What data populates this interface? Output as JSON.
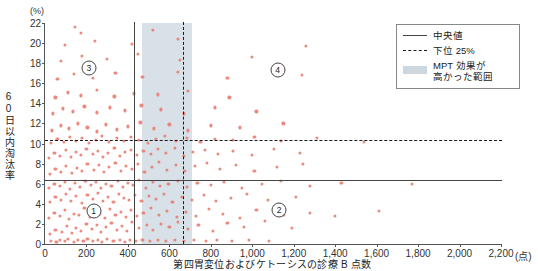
{
  "figure": {
    "title_clipped": "",
    "y_unit": "(%)",
    "x_unit": "(点)",
    "ylabel": "60日以内淘汰率",
    "xlabel": "第四胃変位およびケトーシスの診療 B 点数"
  },
  "legend": {
    "items": [
      {
        "key": "solid-line",
        "label": "中央値"
      },
      {
        "key": "dashed-line",
        "label": "下位 25%"
      },
      {
        "key": "shaded-band",
        "label": "MPT 効果が\n高かった範囲"
      },
      {
        "key": "shaded-band-line1",
        "label": "MPT 効果が"
      },
      {
        "key": "shaded-band-line2",
        "label": "高かった範囲"
      }
    ]
  },
  "regions": [
    {
      "id": "1",
      "label": "①",
      "text": "1",
      "x": 235,
      "y": 3.25
    },
    {
      "id": "2",
      "label": "②",
      "text": "2",
      "x": 1130,
      "y": 3.35
    },
    {
      "id": "3",
      "label": "③",
      "text": "3",
      "x": 212,
      "y": 17.5
    },
    {
      "id": "4",
      "label": "④",
      "text": "4",
      "x": 1122,
      "y": 17.3
    }
  ],
  "chart_data": {
    "type": "scatter",
    "title": "",
    "xlabel": "第四胃変位およびケトーシスの診療 B 点数",
    "ylabel": "60日以内淘汰率",
    "x_unit": "(点)",
    "y_unit": "(%)",
    "xlim": [
      0,
      2200
    ],
    "ylim": [
      0,
      22
    ],
    "xticks": [
      0,
      200,
      400,
      600,
      800,
      1000,
      1200,
      1400,
      1600,
      1800,
      2000,
      2200
    ],
    "xticklabels": [
      "0",
      "200",
      "400",
      "600",
      "800",
      "1,000",
      "1,200",
      "1,400",
      "1,600",
      "1,800",
      "2,000",
      "2,200"
    ],
    "yticks": [
      0,
      2,
      4,
      6,
      8,
      10,
      12,
      14,
      16,
      18,
      20,
      22
    ],
    "yticklabels": [
      "0",
      "2",
      "4",
      "6",
      "8",
      "10",
      "12",
      "14",
      "16",
      "18",
      "20",
      "22"
    ],
    "grid": false,
    "legend_position": "top-right",
    "point_color": "#e8776a",
    "reference_lines": [
      {
        "name": "median-vertical",
        "orient": "vertical",
        "style": "solid",
        "value": 430,
        "label": "中央値"
      },
      {
        "name": "lower25-vertical",
        "orient": "vertical",
        "style": "dashed",
        "value": 665,
        "label": "下位 25%"
      },
      {
        "name": "median-horizontal",
        "orient": "horizontal",
        "style": "solid",
        "value": 6.4,
        "label": "中央値"
      },
      {
        "name": "lower25-horizontal",
        "orient": "horizontal",
        "style": "dashed",
        "value": 10.4,
        "label": "下位 25%"
      }
    ],
    "shaded_bands": [
      {
        "name": "mpt-effective-range",
        "orient": "vertical",
        "from": 470,
        "to": 710,
        "color": "#ccd7e0",
        "label": "MPT 効果が高かった範囲"
      }
    ],
    "points": [
      [
        30,
        0.3
      ],
      [
        55,
        0.2
      ],
      [
        70,
        0.4
      ],
      [
        95,
        0.3
      ],
      [
        110,
        0.5
      ],
      [
        140,
        0.2
      ],
      [
        160,
        0.4
      ],
      [
        185,
        0.3
      ],
      [
        205,
        0.5
      ],
      [
        230,
        0.3
      ],
      [
        255,
        0.4
      ],
      [
        275,
        0.2
      ],
      [
        300,
        0.5
      ],
      [
        330,
        0.3
      ],
      [
        360,
        0.4
      ],
      [
        385,
        0.2
      ],
      [
        410,
        0.4
      ],
      [
        440,
        0.3
      ],
      [
        470,
        0.4
      ],
      [
        505,
        0.3
      ],
      [
        545,
        0.4
      ],
      [
        585,
        0.3
      ],
      [
        625,
        0.4
      ],
      [
        670,
        0.3
      ],
      [
        720,
        0.4
      ],
      [
        775,
        0.3
      ],
      [
        830,
        0.4
      ],
      [
        900,
        0.3
      ],
      [
        985,
        0.4
      ],
      [
        1080,
        0.3
      ],
      [
        25,
        1.0
      ],
      [
        50,
        1.4
      ],
      [
        80,
        1.2
      ],
      [
        105,
        1.8
      ],
      [
        130,
        1.1
      ],
      [
        150,
        1.6
      ],
      [
        175,
        1.3
      ],
      [
        200,
        2.0
      ],
      [
        225,
        1.5
      ],
      [
        250,
        1.9
      ],
      [
        270,
        1.2
      ],
      [
        295,
        1.7
      ],
      [
        320,
        2.1
      ],
      [
        345,
        1.4
      ],
      [
        370,
        1.8
      ],
      [
        395,
        1.3
      ],
      [
        420,
        2.2
      ],
      [
        455,
        1.6
      ],
      [
        490,
        1.9
      ],
      [
        520,
        1.4
      ],
      [
        560,
        2.0
      ],
      [
        600,
        1.7
      ],
      [
        640,
        2.2
      ],
      [
        690,
        1.5
      ],
      [
        740,
        1.9
      ],
      [
        810,
        1.3
      ],
      [
        880,
        2.1
      ],
      [
        960,
        1.7
      ],
      [
        1060,
        2.3
      ],
      [
        1190,
        1.6
      ],
      [
        20,
        2.6
      ],
      [
        45,
        3.1
      ],
      [
        70,
        2.8
      ],
      [
        95,
        3.4
      ],
      [
        115,
        2.5
      ],
      [
        140,
        3.0
      ],
      [
        165,
        2.9
      ],
      [
        190,
        3.6
      ],
      [
        215,
        2.7
      ],
      [
        240,
        3.3
      ],
      [
        265,
        3.0
      ],
      [
        290,
        2.6
      ],
      [
        315,
        3.5
      ],
      [
        340,
        2.9
      ],
      [
        365,
        3.2
      ],
      [
        390,
        2.7
      ],
      [
        415,
        3.4
      ],
      [
        445,
        2.8
      ],
      [
        475,
        3.1
      ],
      [
        510,
        3.6
      ],
      [
        550,
        2.9
      ],
      [
        590,
        3.3
      ],
      [
        635,
        2.7
      ],
      [
        680,
        3.2
      ],
      [
        730,
        2.8
      ],
      [
        790,
        3.5
      ],
      [
        860,
        3.0
      ],
      [
        940,
        2.6
      ],
      [
        1020,
        3.4
      ],
      [
        1150,
        2.9
      ],
      [
        1280,
        3.1
      ],
      [
        1400,
        2.8
      ],
      [
        1610,
        3.3
      ],
      [
        25,
        4.2
      ],
      [
        50,
        4.7
      ],
      [
        75,
        4.4
      ],
      [
        100,
        5.0
      ],
      [
        125,
        4.3
      ],
      [
        150,
        4.8
      ],
      [
        180,
        4.1
      ],
      [
        205,
        4.9
      ],
      [
        230,
        4.5
      ],
      [
        255,
        5.1
      ],
      [
        280,
        4.3
      ],
      [
        305,
        4.7
      ],
      [
        330,
        4.2
      ],
      [
        355,
        5.0
      ],
      [
        380,
        4.6
      ],
      [
        405,
        4.4
      ],
      [
        435,
        4.9
      ],
      [
        465,
        4.3
      ],
      [
        500,
        4.8
      ],
      [
        535,
        4.5
      ],
      [
        575,
        5.0
      ],
      [
        615,
        4.2
      ],
      [
        660,
        4.7
      ],
      [
        710,
        4.4
      ],
      [
        765,
        4.9
      ],
      [
        825,
        4.3
      ],
      [
        895,
        4.6
      ],
      [
        975,
        5.0
      ],
      [
        1075,
        4.4
      ],
      [
        1210,
        4.7
      ],
      [
        20,
        5.6
      ],
      [
        45,
        6.0
      ],
      [
        70,
        5.8
      ],
      [
        95,
        6.2
      ],
      [
        120,
        5.5
      ],
      [
        145,
        6.1
      ],
      [
        170,
        5.7
      ],
      [
        195,
        6.3
      ],
      [
        220,
        5.9
      ],
      [
        245,
        6.2
      ],
      [
        270,
        5.6
      ],
      [
        295,
        6.0
      ],
      [
        320,
        5.8
      ],
      [
        350,
        6.3
      ],
      [
        375,
        5.7
      ],
      [
        400,
        6.1
      ],
      [
        425,
        5.9
      ],
      [
        455,
        6.4
      ],
      [
        485,
        5.6
      ],
      [
        520,
        6.2
      ],
      [
        555,
        5.8
      ],
      [
        595,
        6.0
      ],
      [
        640,
        6.3
      ],
      [
        685,
        5.7
      ],
      [
        735,
        6.1
      ],
      [
        800,
        5.9
      ],
      [
        865,
        6.2
      ],
      [
        950,
        5.6
      ],
      [
        1045,
        6.0
      ],
      [
        1140,
        6.3
      ],
      [
        1280,
        5.8
      ],
      [
        1430,
        6.1
      ],
      [
        1770,
        6.0
      ],
      [
        25,
        7.0
      ],
      [
        50,
        7.5
      ],
      [
        75,
        7.2
      ],
      [
        100,
        7.8
      ],
      [
        130,
        7.1
      ],
      [
        155,
        7.6
      ],
      [
        180,
        7.3
      ],
      [
        205,
        8.0
      ],
      [
        235,
        7.4
      ],
      [
        260,
        7.9
      ],
      [
        285,
        7.2
      ],
      [
        310,
        7.7
      ],
      [
        340,
        8.1
      ],
      [
        365,
        7.3
      ],
      [
        390,
        7.8
      ],
      [
        420,
        7.5
      ],
      [
        450,
        8.0
      ],
      [
        480,
        7.2
      ],
      [
        515,
        7.7
      ],
      [
        550,
        8.2
      ],
      [
        590,
        7.4
      ],
      [
        630,
        7.9
      ],
      [
        675,
        7.3
      ],
      [
        725,
        7.8
      ],
      [
        780,
        8.1
      ],
      [
        845,
        7.5
      ],
      [
        920,
        7.9
      ],
      [
        1010,
        7.3
      ],
      [
        1120,
        7.7
      ],
      [
        1245,
        8.0
      ],
      [
        20,
        8.6
      ],
      [
        45,
        9.1
      ],
      [
        70,
        8.8
      ],
      [
        100,
        9.4
      ],
      [
        125,
        8.7
      ],
      [
        150,
        9.2
      ],
      [
        175,
        8.9
      ],
      [
        200,
        9.5
      ],
      [
        230,
        9.0
      ],
      [
        255,
        9.3
      ],
      [
        280,
        8.7
      ],
      [
        305,
        9.1
      ],
      [
        335,
        9.6
      ],
      [
        360,
        8.8
      ],
      [
        385,
        9.2
      ],
      [
        415,
        9.4
      ],
      [
        445,
        8.9
      ],
      [
        475,
        9.3
      ],
      [
        510,
        9.0
      ],
      [
        545,
        9.5
      ],
      [
        585,
        9.1
      ],
      [
        625,
        9.6
      ],
      [
        670,
        8.8
      ],
      [
        715,
        9.2
      ],
      [
        770,
        9.4
      ],
      [
        835,
        9.0
      ],
      [
        905,
        9.3
      ],
      [
        1000,
        8.9
      ],
      [
        1105,
        9.5
      ],
      [
        1230,
        9.1
      ],
      [
        30,
        10.1
      ],
      [
        60,
        10.5
      ],
      [
        90,
        10.2
      ],
      [
        120,
        10.7
      ],
      [
        150,
        10.3
      ],
      [
        180,
        10.6
      ],
      [
        210,
        10.1
      ],
      [
        245,
        10.4
      ],
      [
        275,
        10.8
      ],
      [
        310,
        10.2
      ],
      [
        345,
        10.6
      ],
      [
        380,
        10.3
      ],
      [
        415,
        10.7
      ],
      [
        455,
        10.4
      ],
      [
        495,
        10.1
      ],
      [
        535,
        10.5
      ],
      [
        580,
        10.8
      ],
      [
        630,
        10.3
      ],
      [
        685,
        10.6
      ],
      [
        750,
        10.2
      ],
      [
        820,
        10.5
      ],
      [
        905,
        10.4
      ],
      [
        1010,
        10.7
      ],
      [
        1140,
        10.3
      ],
      [
        1310,
        10.6
      ],
      [
        1540,
        10.2
      ],
      [
        35,
        11.3
      ],
      [
        75,
        11.8
      ],
      [
        115,
        11.5
      ],
      [
        160,
        12.0
      ],
      [
        205,
        11.6
      ],
      [
        250,
        11.2
      ],
      [
        295,
        11.9
      ],
      [
        345,
        11.4
      ],
      [
        400,
        11.7
      ],
      [
        460,
        12.1
      ],
      [
        525,
        11.5
      ],
      [
        600,
        11.9
      ],
      [
        690,
        11.3
      ],
      [
        800,
        11.8
      ],
      [
        940,
        11.6
      ],
      [
        1150,
        12.0
      ],
      [
        40,
        13.0
      ],
      [
        85,
        13.5
      ],
      [
        135,
        13.2
      ],
      [
        190,
        13.7
      ],
      [
        250,
        13.1
      ],
      [
        315,
        13.6
      ],
      [
        385,
        13.3
      ],
      [
        465,
        13.8
      ],
      [
        560,
        13.4
      ],
      [
        670,
        13.0
      ],
      [
        820,
        13.6
      ],
      [
        1020,
        13.2
      ],
      [
        50,
        14.6
      ],
      [
        110,
        15.1
      ],
      [
        175,
        14.8
      ],
      [
        250,
        15.3
      ],
      [
        335,
        14.7
      ],
      [
        430,
        15.0
      ],
      [
        545,
        14.9
      ],
      [
        690,
        15.2
      ],
      [
        890,
        14.6
      ],
      [
        60,
        16.4
      ],
      [
        140,
        16.9
      ],
      [
        230,
        16.5
      ],
      [
        340,
        17.0
      ],
      [
        470,
        16.6
      ],
      [
        640,
        17.1
      ],
      [
        880,
        16.5
      ],
      [
        1240,
        16.8
      ],
      [
        75,
        18.2
      ],
      [
        180,
        18.7
      ],
      [
        300,
        18.4
      ],
      [
        450,
        18.9
      ],
      [
        650,
        18.3
      ],
      [
        1000,
        18.6
      ],
      [
        95,
        19.8
      ],
      [
        240,
        20.2
      ],
      [
        420,
        19.9
      ],
      [
        640,
        20.4
      ],
      [
        1260,
        19.7
      ],
      [
        175,
        21.0
      ],
      [
        520,
        21.3
      ],
      [
        145,
        21.6
      ]
    ]
  }
}
